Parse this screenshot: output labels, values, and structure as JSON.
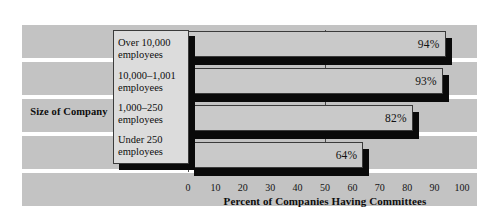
{
  "chart_data": {
    "type": "bar",
    "orientation": "horizontal",
    "title": "",
    "categories": [
      "Over 10,000 employees",
      "10,000–1,001 employees",
      "1,000–250 employees",
      "Under 250 employees"
    ],
    "category_lines": [
      [
        "Over 10,000",
        "employees"
      ],
      [
        "10,000–1,001",
        "employees"
      ],
      [
        "1,000–250",
        "employees"
      ],
      [
        "Under 250",
        "employees"
      ]
    ],
    "values": [
      94,
      93,
      82,
      64
    ],
    "value_labels": [
      "94%",
      "93%",
      "82%",
      "64%"
    ],
    "xlabel": "Percent of Companies Having Committees",
    "ylabel": "Size of Company",
    "xlim": [
      0,
      100
    ],
    "xticks": [
      0,
      10,
      20,
      30,
      40,
      50,
      60,
      70,
      80,
      90,
      100
    ],
    "xtick_labels": [
      "0",
      "10",
      "20",
      "30",
      "40",
      "50",
      "60",
      "70",
      "80",
      "90",
      "100"
    ],
    "gridlines_x": [
      0,
      50
    ],
    "grid": true,
    "legend": false,
    "colors": {
      "background": "#ffffff",
      "band": "#c3c3c3",
      "bar_face": "#c9c9c9",
      "bar_outline": "#3b3b3b",
      "bar_shadow": "#0a0a0a",
      "label_box": "#dcdcdc",
      "text": "#0d0d0d"
    }
  }
}
